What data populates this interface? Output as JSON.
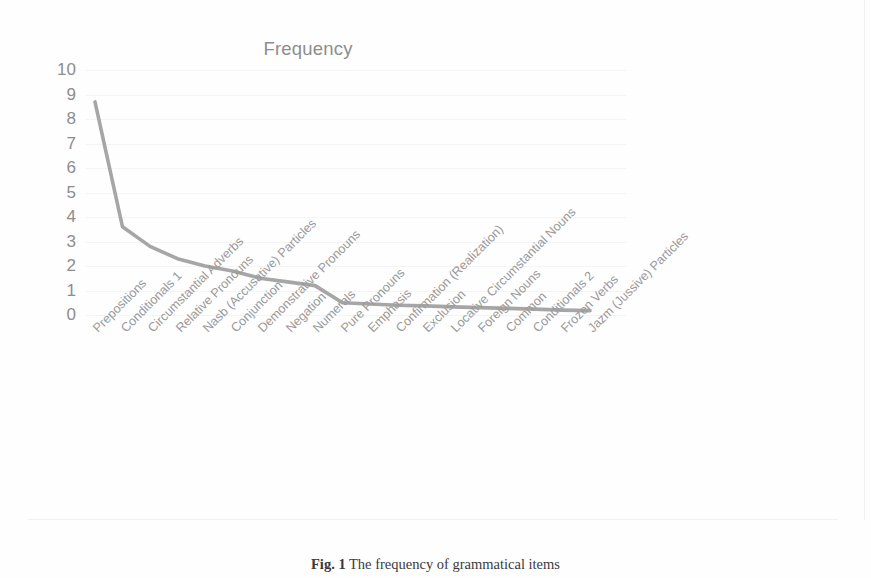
{
  "figure": {
    "caption_label": "Fig. 1",
    "caption_text": "The frequency of grammatical items"
  },
  "chart_data": {
    "type": "line",
    "title": "Frequency",
    "xlabel": "",
    "ylabel": "",
    "ylim": [
      0,
      10
    ],
    "yticks": [
      10,
      9,
      8,
      7,
      6,
      5,
      4,
      3,
      2,
      1,
      0
    ],
    "grid": true,
    "legend_position": "none",
    "line_color": "#a6a6a6",
    "categories": [
      "Prepositions",
      "Conditionals 1",
      "Circumstantial Adverbs",
      "Relative Pronouns",
      "Nasb (Accusative) Particles",
      "Conjunction",
      "Demonstrative Pronouns",
      "Negation",
      "Numerals",
      "Pure Pronouns",
      "Emphasis",
      "Confirmation (Realization)",
      "Exclusion",
      "Locative Circumstantial Nouns",
      "Foreign Nouns",
      "Common",
      "Conditionals 2",
      "Frozen Verbs",
      "Jazm (Jussive) Particles"
    ],
    "values": [
      8.7,
      3.6,
      2.8,
      2.3,
      2.0,
      1.8,
      1.5,
      1.35,
      1.2,
      0.5,
      0.45,
      0.4,
      0.37,
      0.33,
      0.3,
      0.27,
      0.24,
      0.2,
      0.18
    ]
  }
}
